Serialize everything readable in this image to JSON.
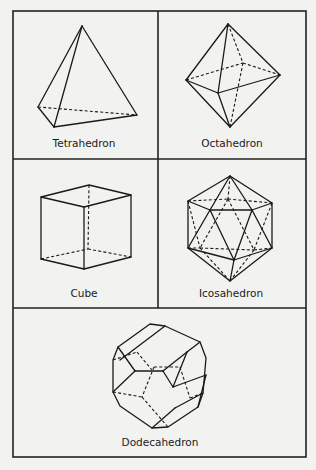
{
  "figure": {
    "panels": [
      {
        "id": "tetrahedron",
        "label": "Tetrahedron"
      },
      {
        "id": "octahedron",
        "label": "Octahedron"
      },
      {
        "id": "cube",
        "label": "Cube"
      },
      {
        "id": "icosahedron",
        "label": "Icosahedron"
      },
      {
        "id": "dodecahedron",
        "label": "Dodecahedron"
      }
    ]
  },
  "colors": {
    "background": "#f2f2f0",
    "line": "#1a1a1a"
  }
}
